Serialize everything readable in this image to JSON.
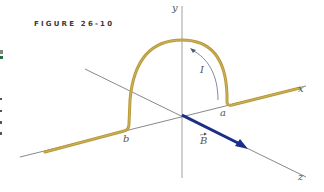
{
  "figure": {
    "label": "FIGURE 26-10"
  },
  "axes": {
    "x": "x",
    "y": "y",
    "z": "z"
  },
  "points": {
    "a": "a",
    "b": "b"
  },
  "current_label": "I",
  "field_label": "B",
  "colors": {
    "wire": "#b89a3a",
    "field_vector": "#1a2f8a",
    "axis": "#555555",
    "y_axis": "#9a9a9a"
  }
}
